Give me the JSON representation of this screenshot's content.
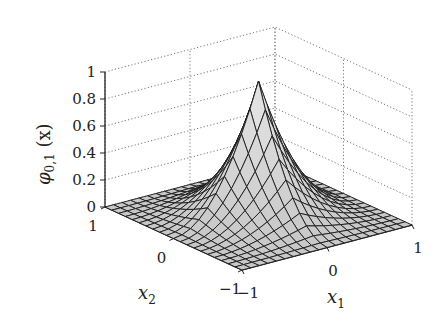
{
  "chart_data": {
    "type": "surface3d",
    "title": "",
    "function": "phi_{0,1}(x) = (1-|x1|)^2 (1-|x2|)^2 style pyramid-like peaked surface",
    "zlabel": "φ0,1 (x)",
    "xlabel": "x1",
    "ylabel": "x2",
    "xlim": [
      -1,
      1
    ],
    "ylim": [
      -1,
      1
    ],
    "zlim": [
      0,
      1
    ],
    "z_ticks": [
      "0",
      "0.2",
      "0.4",
      "0.6",
      "0.8",
      "1"
    ],
    "x1_ticks": [
      "-1",
      "0",
      "1"
    ],
    "x2_ticks": [
      "-1",
      "0",
      "1"
    ],
    "grid": true,
    "grid_style": "dotted",
    "mesh_resolution": 21,
    "peak": {
      "x1": 0,
      "x2": 0,
      "z": 1
    },
    "surface_fill": "#d8d8d8",
    "mesh_color": "#1a1a1a"
  },
  "labels": {
    "z_axis": "φ",
    "z_axis_sub": "0,1",
    "z_axis_arg": " (x)",
    "x1": "x",
    "x1_sub": "1",
    "x2": "x",
    "x2_sub": "2"
  }
}
